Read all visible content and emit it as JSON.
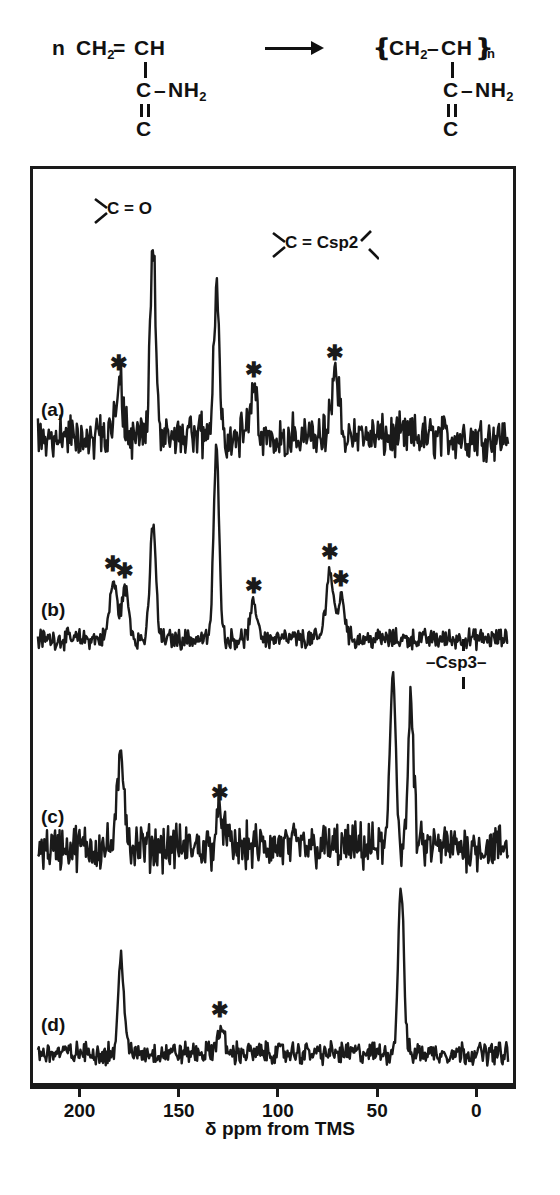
{
  "scheme": {
    "monomer_coefficient": "n",
    "monomer": {
      "backbone": "CH2= CH",
      "ch2": "CH",
      "ch2_sub": "2",
      "eq": "=",
      "ch": "CH",
      "amide_c": "C",
      "amide_link": "–",
      "amide_n": "NH",
      "amide_n_sub": "2",
      "terminal_c": "C"
    },
    "arrow_icon": "right-arrow",
    "polymer": {
      "open_bracket": "❴",
      "ch2": "CH",
      "ch2_sub": "2",
      "dash": "–",
      "ch": "CH",
      "close_bracket": "❵",
      "n_sub": "n",
      "amide_c": "C",
      "amide_link": "–",
      "amide_n": "NH",
      "amide_n_sub": "2",
      "terminal_c": "C"
    }
  },
  "figure": {
    "trace_labels": [
      "(a)",
      "(b)",
      "(c)",
      "(d)"
    ],
    "peak_labels": {
      "carbonyl": "C = O",
      "csp2": "C = Csp2",
      "csp3": "–Csp3–"
    },
    "asterisk_glyph": "✱",
    "asterisk_meaning": "spinning sideband"
  },
  "axis": {
    "title": "δ ppm from TMS",
    "ticks": [
      200,
      150,
      100,
      50,
      0
    ],
    "tick_labels": [
      "200",
      "150",
      "100",
      "50",
      "0"
    ],
    "range_ppm": [
      225,
      -20
    ]
  },
  "caption": "",
  "colors": {
    "ink": "#1a1a1a",
    "background": "#ffffff"
  },
  "chart_data": {
    "type": "line",
    "title": "",
    "xlabel": "δ ppm from TMS",
    "ylabel": "",
    "xlim": [
      225,
      -20
    ],
    "grid": false,
    "legend": "none",
    "note": "Four stacked solid-state 13C NMR spectra (a)-(d); x axis in ppm decreasing left to right; asterisks mark spinning sidebands.",
    "series": [
      {
        "name": "(a)",
        "label": "(a)",
        "peaks": [
          {
            "ppm": 180,
            "rel_height": 0.3,
            "marker": "*"
          },
          {
            "ppm": 163,
            "rel_height": 1.0,
            "marker": ""
          },
          {
            "ppm": 131,
            "rel_height": 0.8,
            "marker": ""
          },
          {
            "ppm": 112,
            "rel_height": 0.26,
            "marker": "*"
          },
          {
            "ppm": 71,
            "rel_height": 0.35,
            "marker": "*"
          }
        ],
        "annotations": [
          "C = O",
          "C = Csp2"
        ],
        "noise_level": 0.09
      },
      {
        "name": "(b)",
        "label": "(b)",
        "peaks": [
          {
            "ppm": 183,
            "rel_height": 0.3,
            "marker": "*"
          },
          {
            "ppm": 177,
            "rel_height": 0.26,
            "marker": "*"
          },
          {
            "ppm": 163,
            "rel_height": 0.62,
            "marker": ""
          },
          {
            "ppm": 131,
            "rel_height": 1.0,
            "marker": ""
          },
          {
            "ppm": 112,
            "rel_height": 0.18,
            "marker": "*"
          },
          {
            "ppm": 74,
            "rel_height": 0.36,
            "marker": "*"
          },
          {
            "ppm": 68,
            "rel_height": 0.22,
            "marker": "*"
          }
        ],
        "noise_level": 0.04
      },
      {
        "name": "(c)",
        "label": "(c)",
        "peaks": [
          {
            "ppm": 179,
            "rel_height": 0.5,
            "marker": ""
          },
          {
            "ppm": 129,
            "rel_height": 0.2,
            "marker": "*"
          },
          {
            "ppm": 42,
            "rel_height": 1.0,
            "marker": ""
          },
          {
            "ppm": 33,
            "rel_height": 0.8,
            "marker": ""
          }
        ],
        "annotations": [
          "–Csp3–"
        ],
        "noise_level": 0.1
      },
      {
        "name": "(d)",
        "label": "(d)",
        "peaks": [
          {
            "ppm": 179,
            "rel_height": 0.58,
            "marker": ""
          },
          {
            "ppm": 129,
            "rel_height": 0.14,
            "marker": "*"
          },
          {
            "ppm": 38,
            "rel_height": 1.0,
            "marker": ""
          }
        ],
        "noise_level": 0.05
      }
    ]
  }
}
